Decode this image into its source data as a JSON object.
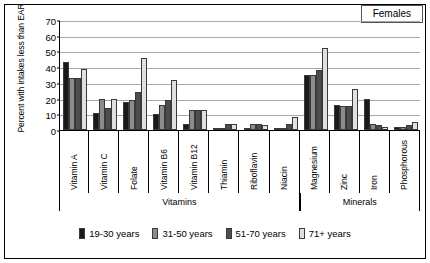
{
  "title_box": {
    "label": "Females"
  },
  "chart_data": {
    "type": "bar",
    "title": "Females",
    "xlabel": "",
    "ylabel": "Percent with intakes less than EAR",
    "ylim": [
      0,
      70
    ],
    "ytick_step": 10,
    "yticks": [
      0,
      10,
      20,
      30,
      40,
      50,
      60,
      70
    ],
    "grid": true,
    "legend_position": "bottom",
    "categories": [
      "Vitamin A",
      "Vitamin C",
      "Folate",
      "Vitamin B6",
      "Vitamin B12",
      "Thiamin",
      "Riboflavin",
      "Niacin",
      "Magnesium",
      "Zinc",
      "Iron",
      "Phosphorous"
    ],
    "category_groups": [
      {
        "label": "Vitamins",
        "start": 0,
        "end": 7
      },
      {
        "label": "Minerals",
        "start": 8,
        "end": 11
      }
    ],
    "series": [
      {
        "name": "19-30 years",
        "color": "#1a1a1a",
        "values": [
          43,
          11,
          18,
          10,
          4,
          0,
          0,
          0,
          35,
          16,
          20,
          2
        ]
      },
      {
        "name": "31-50 years",
        "color": "#8c8c8c",
        "values": [
          33,
          20,
          19,
          16,
          13,
          0,
          4,
          0,
          35,
          15,
          4,
          2
        ]
      },
      {
        "name": "51-70 years",
        "color": "#4d4d4d",
        "values": [
          33,
          14,
          24,
          19,
          13,
          4,
          4,
          4,
          38,
          15,
          3,
          3
        ]
      },
      {
        "name": "71+ years",
        "color": "#e0e0e0",
        "values": [
          39,
          20,
          46,
          32,
          13,
          4,
          3,
          8,
          52,
          26,
          2,
          5
        ]
      }
    ]
  }
}
